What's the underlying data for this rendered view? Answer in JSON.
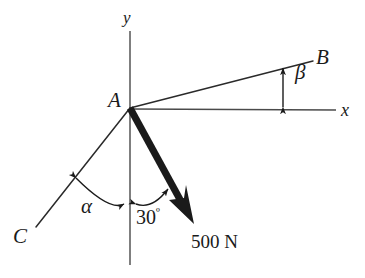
{
  "figure": {
    "type": "free-body-force-diagram",
    "background_color": "#ffffff",
    "ink_color": "#1a1a1a",
    "labels": {
      "point_a": "A",
      "point_b": "B",
      "point_c": "C",
      "axis_x": "x",
      "axis_y": "y",
      "angle_alpha": "α",
      "angle_beta": "β",
      "angle_30_value": "30",
      "angle_30_unit": "º",
      "force_magnitude": "500 N"
    },
    "geometry": {
      "origin": {
        "x": 130,
        "y": 108,
        "name": "A"
      },
      "y_axis": {
        "x": 130,
        "y_top": 31,
        "y_bottom": 265
      },
      "x_axis": {
        "y": 109,
        "x_start": 130,
        "x_end": 336
      },
      "line_ab": {
        "x1": 130,
        "y1": 108,
        "x2": 313,
        "y2": 61
      },
      "line_ac": {
        "x1": 130,
        "y1": 108,
        "x2": 36,
        "y2": 227
      },
      "force_vector": {
        "x1": 130,
        "y1": 108,
        "x2": 192,
        "y2": 221,
        "thickness": 7
      },
      "beta_marker": {
        "x": 283,
        "y_top": 66,
        "y_bottom": 108
      },
      "alpha_arc": {
        "from": "line-AC",
        "to": "y-axis-down"
      },
      "angle30_arc": {
        "from": "y-axis-down",
        "to": "force-vector"
      }
    },
    "values": {
      "force_newtons": 500,
      "angle_from_y_axis_deg": 30
    }
  }
}
